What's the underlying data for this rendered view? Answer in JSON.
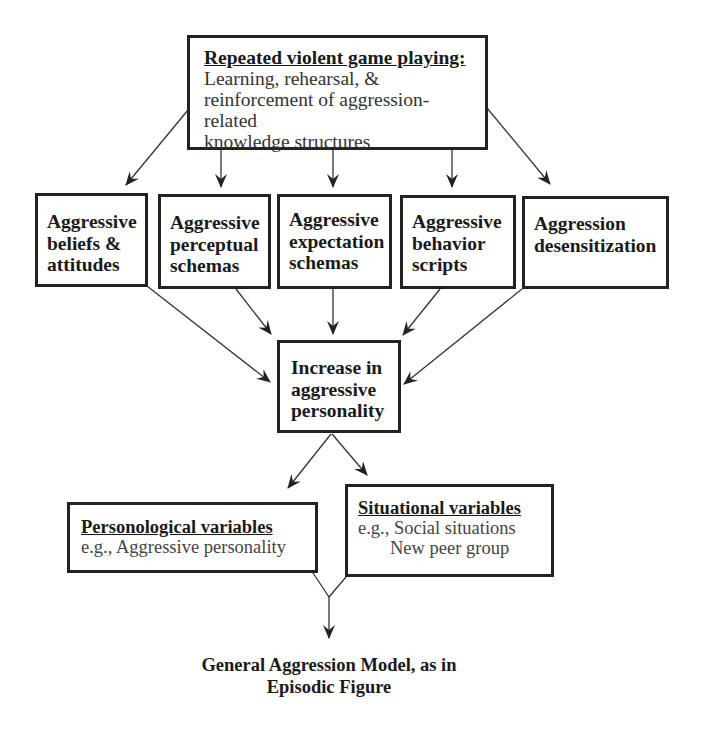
{
  "diagram": {
    "top": {
      "title": "Repeated violent game playing:",
      "lines": [
        "Learning, rehearsal, &",
        "reinforcement of aggression-related",
        "knowledge structures"
      ]
    },
    "knowledge_structures": [
      {
        "lines": [
          "Aggressive",
          "beliefs &",
          "attitudes"
        ]
      },
      {
        "lines": [
          "Aggressive",
          "perceptual",
          "schemas"
        ]
      },
      {
        "lines": [
          "Aggressive",
          "expectation",
          "schemas"
        ]
      },
      {
        "lines": [
          "Aggressive",
          "behavior",
          "scripts"
        ]
      },
      {
        "lines": [
          "Aggression",
          "desensitization"
        ]
      }
    ],
    "center": {
      "lines": [
        "Increase in",
        "aggressive",
        "personality"
      ]
    },
    "personological": {
      "title": "Personological variables",
      "lines": [
        "e.g., Aggressive personality"
      ]
    },
    "situational": {
      "title": "Situational variables",
      "lines": [
        "e.g., Social situations",
        "New peer group"
      ]
    },
    "caption": {
      "lines": [
        "General Aggression Model, as in",
        "Episodic Figure"
      ]
    },
    "edges": [
      {
        "from": "top",
        "to": "knowledge_structures.0"
      },
      {
        "from": "top",
        "to": "knowledge_structures.1"
      },
      {
        "from": "top",
        "to": "knowledge_structures.2"
      },
      {
        "from": "top",
        "to": "knowledge_structures.3"
      },
      {
        "from": "top",
        "to": "knowledge_structures.4"
      },
      {
        "from": "knowledge_structures.0",
        "to": "center"
      },
      {
        "from": "knowledge_structures.1",
        "to": "center"
      },
      {
        "from": "knowledge_structures.2",
        "to": "center"
      },
      {
        "from": "knowledge_structures.3",
        "to": "center"
      },
      {
        "from": "knowledge_structures.4",
        "to": "center"
      },
      {
        "from": "center",
        "to": "personological"
      },
      {
        "from": "center",
        "to": "situational"
      },
      {
        "from": "personological",
        "to": "caption"
      },
      {
        "from": "situational",
        "to": "caption"
      }
    ]
  }
}
